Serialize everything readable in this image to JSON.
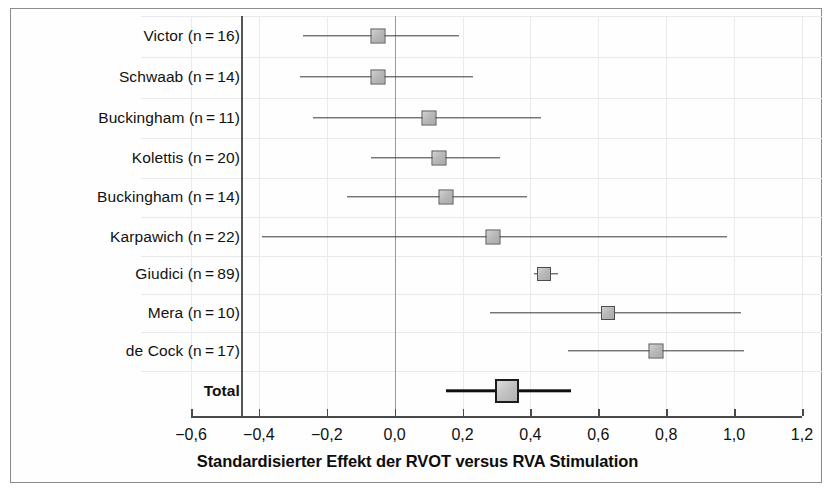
{
  "chart_data": {
    "type": "scatter",
    "subtype": "forest-plot",
    "title": "",
    "xlabel": "Standardisierter Effekt der RVOT versus RVA Stimulation",
    "ylabel": "",
    "xlim": [
      -0.6,
      1.2
    ],
    "xticks": [
      -0.6,
      -0.4,
      -0.2,
      0.0,
      0.2,
      0.4,
      0.6,
      0.8,
      1.0,
      1.2
    ],
    "xtick_labels": [
      "−0,6",
      "−0,4",
      "−0,2",
      "0,0",
      "0,2",
      "0,4",
      "0,6",
      "0,8",
      "1,0",
      "1,2"
    ],
    "grid": true,
    "legend": "none",
    "reference_line": 0.0,
    "categories": [
      "Victor (n = 16)",
      "Schwaab (n = 14)",
      "Buckingham (n = 11)",
      "Kolettis (n = 20)",
      "Buckingham (n = 14)",
      "Karpawich (n = 22)",
      "Giudici (n = 89)",
      "Mera (n = 10)",
      "de Cock (n = 17)",
      "Total"
    ],
    "values": [
      -0.05,
      -0.05,
      0.1,
      0.13,
      0.15,
      0.29,
      0.44,
      0.63,
      0.77,
      0.33
    ],
    "ci_low": [
      -0.27,
      -0.28,
      -0.24,
      -0.07,
      -0.14,
      -0.39,
      0.41,
      0.28,
      0.51,
      0.15
    ],
    "ci_high": [
      0.19,
      0.23,
      0.43,
      0.31,
      0.39,
      0.98,
      0.48,
      1.02,
      1.03,
      0.52
    ]
  },
  "studies": [
    {
      "label": "Victor (n = 16)",
      "effect": -0.05,
      "low": -0.27,
      "high": 0.19,
      "n": 16,
      "marker": 15,
      "total": false
    },
    {
      "label": "Schwaab (n = 14)",
      "effect": -0.05,
      "low": -0.28,
      "high": 0.23,
      "n": 14,
      "marker": 15,
      "total": false
    },
    {
      "label": "Buckingham (n = 11)",
      "effect": 0.1,
      "low": -0.24,
      "high": 0.43,
      "n": 11,
      "marker": 15,
      "total": false
    },
    {
      "label": "Kolettis (n = 20)",
      "effect": 0.13,
      "low": -0.07,
      "high": 0.31,
      "n": 20,
      "marker": 15,
      "total": false
    },
    {
      "label": "Buckingham (n = 14)",
      "effect": 0.15,
      "low": -0.14,
      "high": 0.39,
      "n": 14,
      "marker": 15,
      "total": false
    },
    {
      "label": "Karpawich (n = 22)",
      "effect": 0.29,
      "low": -0.39,
      "high": 0.98,
      "n": 22,
      "marker": 15,
      "total": false
    },
    {
      "label": "Giudici (n = 89)",
      "effect": 0.44,
      "low": 0.41,
      "high": 0.48,
      "n": 89,
      "marker": 14,
      "total": false
    },
    {
      "label": "Mera (n = 10)",
      "effect": 0.63,
      "low": 0.28,
      "high": 1.02,
      "n": 10,
      "marker": 14,
      "total": false
    },
    {
      "label": "de Cock (n = 17)",
      "effect": 0.77,
      "low": 0.51,
      "high": 1.03,
      "n": 17,
      "marker": 15,
      "total": false
    },
    {
      "label": "Total",
      "effect": 0.33,
      "low": 0.15,
      "high": 0.52,
      "n": 0,
      "marker": 24,
      "total": true
    }
  ],
  "axis": {
    "title": "Standardisierter Effekt der RVOT versus RVA Stimulation",
    "tick_labels": [
      "−0,6",
      "−0,4",
      "−0,2",
      "0,0",
      "0,2",
      "0,4",
      "0,6",
      "0,8",
      "1,0",
      "1,2"
    ],
    "tick_values": [
      -0.6,
      -0.4,
      -0.2,
      0.0,
      0.2,
      0.4,
      0.6,
      0.8,
      1.0,
      1.2
    ]
  },
  "colors": {
    "frame": "#8c8c8c",
    "grid": "#e9e9e9",
    "axis": "#4a4a4a",
    "marker_fill": "#bdbdbd",
    "marker_edge": "#4e4e4e",
    "ci_line": "#3a3a3a",
    "zero_line": "#9a9a9a",
    "text": "#111111",
    "background": "#ffffff"
  },
  "geometry": {
    "x0_px": 191,
    "px_per_unit": 339.4,
    "row_y": [
      36,
      77,
      118,
      158,
      197,
      237,
      274,
      313,
      351,
      391
    ],
    "axis_y": 416,
    "plot_top": 16,
    "plot_left": 241
  }
}
